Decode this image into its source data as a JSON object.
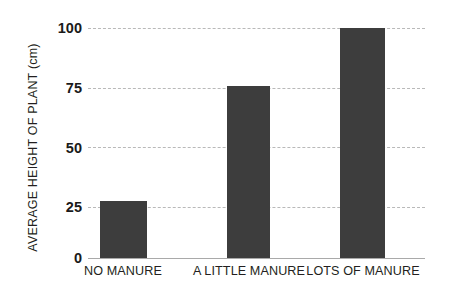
{
  "chart_data": {
    "type": "bar",
    "title": "",
    "subtitle": "",
    "xlabel": "",
    "ylabel": "AVERAGE HEIGHT OF PLANT (cm)",
    "categories": [
      "NO MANURE",
      "A LITTLE MANURE",
      "LOTS OF MANURE"
    ],
    "values": [
      25,
      75,
      100
    ],
    "ylim": [
      0,
      100
    ],
    "yticks": [
      "0",
      "25",
      "50",
      "75",
      "100"
    ],
    "ytick_values": [
      0,
      25,
      50,
      75,
      100
    ],
    "grid": true,
    "grid_style": "dashed",
    "legend": "none",
    "bar_color": "#3d3d3d",
    "grid_color": "#b9b9b9",
    "axis_color": "#a9a9a9",
    "text_color": "#231f20"
  },
  "axes": {
    "y_title": "AVERAGE HEIGHT OF PLANT (cm)",
    "ticks": [
      {
        "label": "100",
        "value": 100
      },
      {
        "label": "75",
        "value": 75
      },
      {
        "label": "50",
        "value": 50
      },
      {
        "label": "25",
        "value": 25
      },
      {
        "label": "0",
        "value": 0
      }
    ]
  },
  "bars": [
    {
      "label": "NO MANURE",
      "value": 25
    },
    {
      "label": "A LITTLE MANURE",
      "value": 75
    },
    {
      "label": "LOTS OF MANURE",
      "value": 100
    }
  ]
}
